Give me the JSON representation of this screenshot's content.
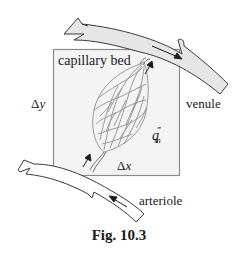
{
  "figure": {
    "caption": "Fig. 10.3",
    "labels": {
      "capillary_bed": "capillary bed",
      "delta_y_symbol": "Δ",
      "delta_y_var": "y",
      "delta_x_symbol": "Δ",
      "delta_x_var": "x",
      "q_base": "q",
      "q_sub": "m",
      "q_sup": "‴",
      "venule": "venule",
      "arteriole": "arteriole"
    },
    "colors": {
      "box_fill": "#f4f4f4",
      "box_stroke": "#8a8a8a",
      "venule_fill": "#e6e6e6",
      "arteriole_fill": "#ffffff",
      "vessel_stroke": "#3a3a3a",
      "capillary_stroke": "#9a9a9a",
      "arrow": "#1a1a1a"
    }
  }
}
